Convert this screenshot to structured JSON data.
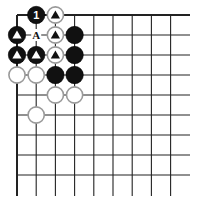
{
  "board": {
    "columns": 9,
    "rows": 9,
    "origin_x": 17,
    "origin_y": 15,
    "spacing_x": 19.2,
    "spacing_y": 20,
    "line_end_x": 190,
    "line_end_y": 196,
    "line_color": "#222222",
    "edge_top": true,
    "edge_left": true
  },
  "stones": [
    {
      "col": 1,
      "row": 0,
      "color": "black",
      "mark": "1"
    },
    {
      "col": 2,
      "row": 0,
      "color": "white",
      "mark": "triangle"
    },
    {
      "col": 0,
      "row": 1,
      "color": "black",
      "mark": "triangle"
    },
    {
      "col": 2,
      "row": 1,
      "color": "white",
      "mark": "triangle"
    },
    {
      "col": 3,
      "row": 1,
      "color": "black",
      "mark": ""
    },
    {
      "col": 0,
      "row": 2,
      "color": "black",
      "mark": "triangle"
    },
    {
      "col": 1,
      "row": 2,
      "color": "black",
      "mark": "triangle"
    },
    {
      "col": 2,
      "row": 2,
      "color": "white",
      "mark": "triangle"
    },
    {
      "col": 3,
      "row": 2,
      "color": "black",
      "mark": ""
    },
    {
      "col": 0,
      "row": 3,
      "color": "white",
      "mark": ""
    },
    {
      "col": 1,
      "row": 3,
      "color": "white",
      "mark": ""
    },
    {
      "col": 2,
      "row": 3,
      "color": "black",
      "mark": ""
    },
    {
      "col": 3,
      "row": 3,
      "color": "black",
      "mark": ""
    },
    {
      "col": 2,
      "row": 4,
      "color": "white",
      "mark": ""
    },
    {
      "col": 3,
      "row": 4,
      "color": "white",
      "mark": ""
    },
    {
      "col": 1,
      "row": 5,
      "color": "white",
      "mark": ""
    }
  ],
  "labels": [
    {
      "col": 1,
      "row": 1,
      "text": "A"
    }
  ],
  "colors": {
    "black_stone": "#111111",
    "white_stone": "#ffffff",
    "white_stone_border": "#9a9a9a",
    "mark_on_black": "#ffffff",
    "mark_on_white": "#111111"
  }
}
